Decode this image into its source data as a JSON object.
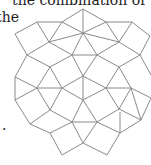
{
  "text": {
    "line1": "the combination of",
    "line2": "the",
    "trailing_period": "."
  },
  "figure": {
    "type": "square-triangle-tiling",
    "stroke_color": "#8a8a8a",
    "background_color": "#ffffff",
    "edges": [
      [
        83,
        9,
        62,
        22
      ],
      [
        83,
        9,
        106,
        22
      ],
      [
        83,
        9,
        83,
        33
      ],
      [
        37,
        22,
        62,
        22
      ],
      [
        106,
        22,
        132,
        22
      ],
      [
        37,
        22,
        15,
        34
      ],
      [
        132,
        22,
        150,
        36
      ],
      [
        62,
        22,
        83,
        33
      ],
      [
        106,
        22,
        83,
        33
      ],
      [
        62,
        22,
        49,
        42
      ],
      [
        37,
        22,
        49,
        42
      ],
      [
        106,
        22,
        119,
        42
      ],
      [
        132,
        22,
        119,
        42
      ],
      [
        83,
        33,
        119,
        42
      ],
      [
        83,
        33,
        49,
        42
      ],
      [
        15,
        34,
        27,
        55
      ],
      [
        49,
        42,
        27,
        55
      ],
      [
        49,
        42,
        72,
        55
      ],
      [
        83,
        33,
        72,
        55
      ],
      [
        83,
        33,
        97,
        55
      ],
      [
        119,
        42,
        97,
        55
      ],
      [
        119,
        42,
        140,
        55
      ],
      [
        150,
        36,
        140,
        55
      ],
      [
        72,
        55,
        97,
        55
      ],
      [
        27,
        55,
        50,
        67
      ],
      [
        72,
        55,
        50,
        67
      ],
      [
        97,
        55,
        119,
        67
      ],
      [
        140,
        55,
        119,
        67
      ],
      [
        140,
        55,
        151,
        75
      ],
      [
        27,
        55,
        15,
        77
      ],
      [
        50,
        67,
        37,
        88
      ],
      [
        50,
        67,
        62,
        88
      ],
      [
        37,
        88,
        62,
        88
      ],
      [
        15,
        77,
        37,
        88
      ],
      [
        72,
        55,
        83,
        76
      ],
      [
        97,
        55,
        83,
        76
      ],
      [
        83,
        76,
        62,
        88
      ],
      [
        83,
        76,
        106,
        88
      ],
      [
        83,
        76,
        83,
        100
      ],
      [
        119,
        67,
        106,
        88
      ],
      [
        119,
        67,
        131,
        88
      ],
      [
        106,
        88,
        131,
        88
      ],
      [
        131,
        88,
        151,
        98
      ],
      [
        15,
        77,
        15,
        100
      ],
      [
        37,
        88,
        15,
        100
      ],
      [
        37,
        88,
        50,
        110
      ],
      [
        62,
        88,
        50,
        110
      ],
      [
        62,
        88,
        83,
        100
      ],
      [
        106,
        88,
        83,
        100
      ],
      [
        106,
        88,
        119,
        109
      ],
      [
        131,
        88,
        119,
        109
      ],
      [
        131,
        88,
        141,
        120
      ],
      [
        151,
        98,
        141,
        120
      ],
      [
        15,
        100,
        30,
        124
      ],
      [
        50,
        110,
        30,
        124
      ],
      [
        50,
        110,
        72,
        122
      ],
      [
        83,
        100,
        72,
        122
      ],
      [
        83,
        100,
        97,
        122
      ],
      [
        119,
        109,
        97,
        122
      ],
      [
        119,
        109,
        141,
        120
      ],
      [
        72,
        122,
        97,
        122
      ],
      [
        30,
        124,
        50,
        133
      ],
      [
        72,
        122,
        50,
        133
      ],
      [
        97,
        122,
        120,
        133
      ],
      [
        141,
        120,
        120,
        133
      ],
      [
        120,
        112,
        120,
        133
      ],
      [
        50,
        133,
        62,
        155
      ],
      [
        72,
        122,
        83,
        143
      ],
      [
        97,
        122,
        83,
        143
      ],
      [
        83,
        143,
        62,
        155
      ],
      [
        83,
        143,
        107,
        155
      ],
      [
        120,
        133,
        107,
        155
      ]
    ]
  }
}
